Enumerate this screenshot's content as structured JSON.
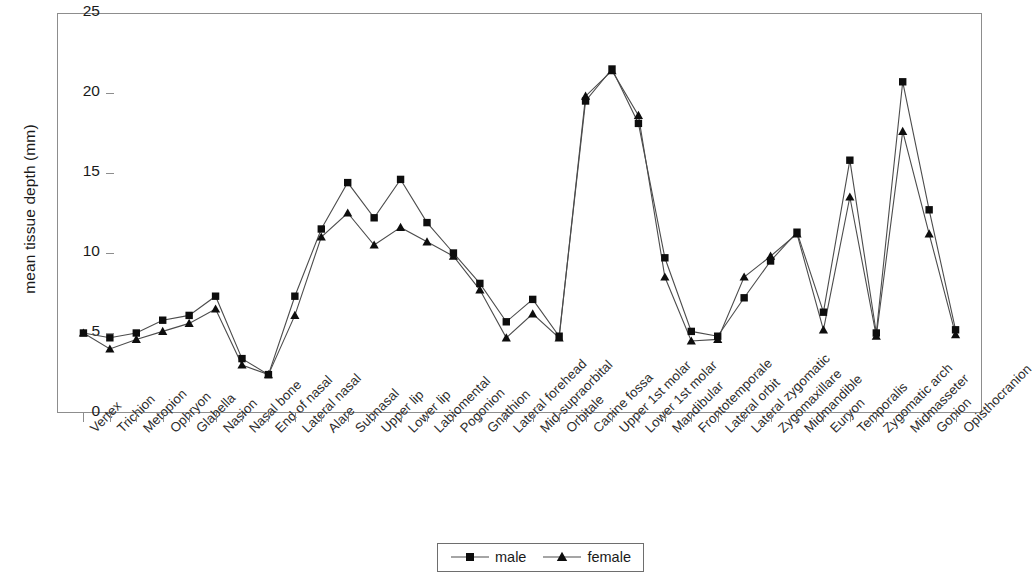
{
  "chart_data": {
    "type": "line",
    "title": "",
    "subtitle": "",
    "xlabel": "",
    "ylabel": "mean tissue depth (mm)",
    "ylim": [
      0,
      25
    ],
    "yticks": [
      0,
      5,
      10,
      15,
      20,
      25
    ],
    "grid": false,
    "legend_position": "bottom-center",
    "categories": [
      "Vertex",
      "Trichion",
      "Metopion",
      "Ophryon",
      "Glabella",
      "Nasion",
      "Nasal bone",
      "End of nasal",
      "Lateral nasal",
      "Alare",
      "Subnasal",
      "Upper lip",
      "Lower lip",
      "Labiomental",
      "Pogonion",
      "Gnathion",
      "Lateral forehead",
      "Mid-supraorbital",
      "Orbitale",
      "Canine fossa",
      "Upper 1st molar",
      "Lower 1st molar",
      "Mandibular",
      "Frontotemporale",
      "Lateral orbit",
      "Lateral zygomatic",
      "Zygomaxillare",
      "Midmandible",
      "Euryon",
      "Temporalis",
      "Zygomatic arch",
      "Midmasseter",
      "Gonion",
      "Opisthocranion"
    ],
    "series": [
      {
        "name": "male",
        "marker": "square",
        "color": "#0d0d0d",
        "values": [
          5.0,
          4.7,
          5.0,
          5.8,
          6.1,
          7.3,
          3.4,
          2.4,
          7.3,
          11.5,
          14.4,
          12.2,
          14.6,
          11.9,
          10.0,
          8.1,
          5.7,
          7.1,
          4.8,
          19.5,
          21.5,
          18.1,
          9.7,
          5.1,
          4.8,
          7.2,
          9.5,
          11.3,
          6.3,
          15.8,
          5.0,
          20.7,
          12.7,
          5.2
        ]
      },
      {
        "name": "female",
        "marker": "triangle",
        "color": "#0d0d0d",
        "values": [
          5.0,
          4.0,
          4.6,
          5.1,
          5.6,
          6.5,
          3.0,
          2.4,
          6.1,
          11.0,
          12.5,
          10.5,
          11.6,
          10.7,
          9.8,
          7.7,
          4.7,
          6.2,
          4.7,
          19.8,
          21.4,
          18.6,
          8.5,
          4.5,
          4.6,
          8.5,
          9.8,
          11.2,
          5.2,
          13.5,
          4.8,
          17.6,
          11.2,
          4.9
        ]
      }
    ]
  },
  "legend": {
    "entries": [
      {
        "label": "male",
        "marker": "square-marker"
      },
      {
        "label": "female",
        "marker": "triangle-marker"
      }
    ]
  },
  "axes": {
    "y_title": "mean tissue depth (mm)"
  }
}
